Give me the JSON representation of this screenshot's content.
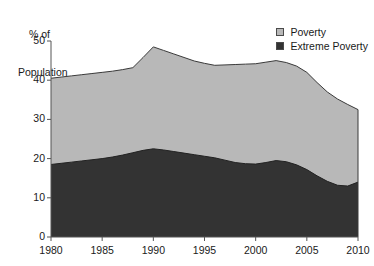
{
  "chart_data": {
    "type": "area",
    "stacked": true,
    "title": "",
    "xlabel": "",
    "ylabel": "% of\nPopulation",
    "ylabel_lines": [
      "% of",
      "Population"
    ],
    "xlim": [
      1980,
      2010
    ],
    "ylim": [
      0,
      50
    ],
    "yticks": [
      0,
      10,
      20,
      30,
      40,
      50
    ],
    "ytick_labels": [
      "0",
      "10",
      "20",
      "30",
      "40",
      "50"
    ],
    "xticks": [
      1980,
      1985,
      1990,
      1995,
      2000,
      2005,
      2010
    ],
    "xtick_labels": [
      "1980",
      "1985",
      "1990",
      "1995",
      "2000",
      "2005",
      "2010"
    ],
    "grid": false,
    "legend_position": "top-right",
    "x": [
      1980,
      1981,
      1982,
      1983,
      1984,
      1985,
      1986,
      1987,
      1988,
      1989,
      1990,
      1991,
      1992,
      1993,
      1994,
      1995,
      1996,
      1997,
      1998,
      1999,
      2000,
      2001,
      2002,
      2003,
      2004,
      2005,
      2006,
      2007,
      2008,
      2009,
      2010
    ],
    "series": [
      {
        "name": "Poverty",
        "color": "#b8b8b8",
        "note": "Upper boundary of stacked area (total poverty, includes extreme poverty)",
        "values": [
          40.5,
          40.8,
          41.1,
          41.4,
          41.7,
          42.0,
          42.3,
          42.7,
          43.2,
          45.8,
          48.5,
          47.6,
          46.7,
          45.8,
          44.9,
          44.3,
          43.8,
          43.9,
          44.0,
          44.1,
          44.2,
          44.6,
          45.0,
          44.5,
          43.6,
          42.0,
          39.4,
          37.0,
          35.2,
          33.8,
          32.5
        ]
      },
      {
        "name": "Extreme Poverty",
        "color": "#333333",
        "note": "Lower band of stacked area",
        "values": [
          18.5,
          18.8,
          19.1,
          19.4,
          19.7,
          20.0,
          20.4,
          20.9,
          21.5,
          22.1,
          22.5,
          22.2,
          21.8,
          21.4,
          21.0,
          20.6,
          20.2,
          19.6,
          19.0,
          18.7,
          18.6,
          19.0,
          19.5,
          19.2,
          18.4,
          17.2,
          15.6,
          14.2,
          13.2,
          13.0,
          14.0
        ]
      }
    ]
  },
  "legend": {
    "items": [
      {
        "label": "Poverty",
        "color": "#b8b8b8"
      },
      {
        "label": "Extreme Poverty",
        "color": "#333333"
      }
    ]
  },
  "colors": {
    "poverty": "#b8b8b8",
    "extreme_poverty": "#333333",
    "axis": "#555555",
    "outline": "#3a3a3a"
  }
}
